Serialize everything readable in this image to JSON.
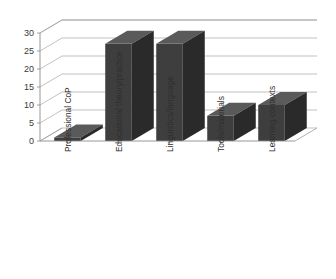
{
  "chart_data": {
    "type": "bar",
    "title": "",
    "subtitle": "",
    "xlabel": "",
    "ylabel": "",
    "categories": [
      "Professional CoP",
      "Educational theory/practice",
      "Linguistics/language",
      "Tools/materials",
      "Learning contexts"
    ],
    "values": [
      1,
      27,
      27,
      7,
      10
    ],
    "ylim": [
      0,
      30
    ],
    "yticks": [
      0,
      5,
      10,
      15,
      20,
      25,
      30
    ],
    "ytick_labels": [
      "0",
      "5",
      "10",
      "15",
      "20",
      "25",
      "30"
    ],
    "grid": true,
    "legend": "none",
    "style": "3d-column",
    "colors": {
      "bar_front": "#3e3e3e",
      "bar_top": "#5a5a5a",
      "bar_side": "#2a2a2a",
      "gridline": "#a6a6a6",
      "axis": "#8c8c8c",
      "background": "#ffffff",
      "text": "#2f2f2f"
    }
  }
}
